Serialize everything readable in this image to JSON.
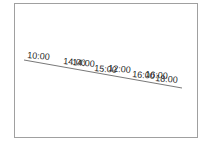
{
  "diagram": {
    "type": "timeline",
    "colors": {
      "frame": "#a0a0a0",
      "axis": "#555555",
      "text": "#222222"
    },
    "axis": {
      "x1": 24,
      "y1": 60,
      "x2": 182,
      "y2": 88
    },
    "labels": [
      {
        "text": "10:00",
        "x": 27,
        "y": 58
      },
      {
        "text": "14:00",
        "x": 63,
        "y": 64
      },
      {
        "text": "14:00",
        "x": 72,
        "y": 65
      },
      {
        "text": "15:00",
        "x": 94,
        "y": 71
      },
      {
        "text": "12:00",
        "x": 108,
        "y": 71
      },
      {
        "text": "16:00",
        "x": 132,
        "y": 77
      },
      {
        "text": "16:00",
        "x": 145,
        "y": 77
      },
      {
        "text": "18:00",
        "x": 155,
        "y": 81
      }
    ]
  }
}
